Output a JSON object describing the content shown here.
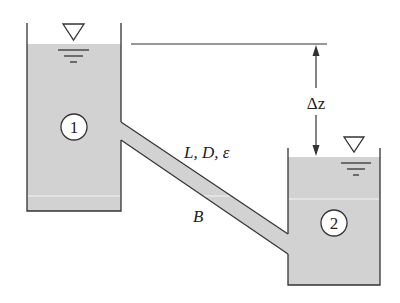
{
  "diagram": {
    "colors": {
      "water": "#d2d2d2",
      "stroke": "#333333",
      "background": "#ffffff"
    },
    "reservoir_1": {
      "label": "1"
    },
    "reservoir_2": {
      "label": "2"
    },
    "pipe": {
      "label": "L, D, ε",
      "point_label": "B"
    },
    "elevation_difference": {
      "label": "Δz"
    },
    "free_surface_symbol": "water-surface-triangle"
  }
}
